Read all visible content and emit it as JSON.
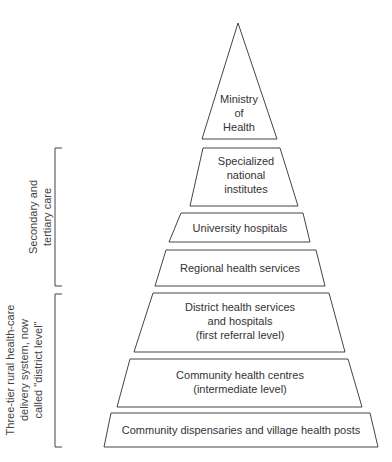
{
  "diagram": {
    "type": "pyramid",
    "levels": [
      {
        "id": "ministry",
        "lines": [
          "Ministry",
          "of",
          "Health"
        ]
      },
      {
        "id": "specialized",
        "lines": [
          "Specialized",
          "national",
          "institutes"
        ]
      },
      {
        "id": "university",
        "lines": [
          "University hospitals"
        ]
      },
      {
        "id": "regional",
        "lines": [
          "Regional health services"
        ]
      },
      {
        "id": "district",
        "lines": [
          "District health services",
          "and hospitals",
          "(first referral level)"
        ]
      },
      {
        "id": "community-centres",
        "lines": [
          "Community health centres",
          "(intermediate level)"
        ]
      },
      {
        "id": "dispensaries",
        "lines": [
          "Community dispensaries and village health posts"
        ]
      }
    ],
    "brackets": [
      {
        "id": "secondary-tertiary",
        "lines": [
          "Secondary and",
          "tertiary care"
        ],
        "spans": [
          "specialized",
          "university",
          "regional"
        ]
      },
      {
        "id": "district-level",
        "lines": [
          "Three-tier rural health-care",
          "delivery system, now",
          "called \"district level\""
        ],
        "spans": [
          "district",
          "community-centres",
          "dispensaries"
        ]
      }
    ],
    "line_color": "#444444"
  }
}
